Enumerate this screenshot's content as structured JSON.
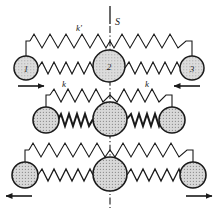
{
  "figure": {
    "background_color": "#ffffff",
    "ink_color": "#1a1a1a",
    "mass_fill_color": "#d9d9d9",
    "width": 219,
    "height": 215
  },
  "annotations": {
    "symmetry_axis_label": "S",
    "outer_spring_label": "k'",
    "inner_spring_label_left": "k",
    "inner_spring_label_right": "k",
    "mass_1_label": "1",
    "mass_2_label": "2",
    "mass_3_label": "3"
  },
  "modes": [
    {
      "name": "mode-1",
      "index": 1,
      "labels_visible": true,
      "masses": [
        {
          "id": "mass-1",
          "label": "1",
          "cx": 26,
          "cy": 68,
          "r": 12,
          "arrow": "right"
        },
        {
          "id": "mass-2",
          "label": "2",
          "cx": 109,
          "cy": 66,
          "r": 16,
          "arrow": "none"
        },
        {
          "id": "mass-3",
          "label": "3",
          "cx": 192,
          "cy": 68,
          "r": 12,
          "arrow": "left"
        }
      ],
      "arrow_directions": [
        "right",
        "none",
        "left"
      ],
      "spring_label_left": "k",
      "spring_label_right": "k",
      "outer_spring_label": "k'"
    },
    {
      "name": "mode-2",
      "index": 2,
      "labels_visible": false,
      "masses": [
        {
          "id": "mass-1",
          "label": "",
          "cx": 46,
          "cy": 120,
          "r": 13,
          "arrow": "none"
        },
        {
          "id": "mass-2",
          "label": "",
          "cx": 110,
          "cy": 119,
          "r": 17,
          "arrow": "none"
        },
        {
          "id": "mass-3",
          "label": "",
          "cx": 172,
          "cy": 120,
          "r": 13,
          "arrow": "none"
        }
      ],
      "arrow_directions": [
        "none",
        "none",
        "none"
      ],
      "spring_label_left": "",
      "spring_label_right": "",
      "outer_spring_label": ""
    },
    {
      "name": "mode-3",
      "index": 3,
      "labels_visible": false,
      "masses": [
        {
          "id": "mass-1",
          "label": "",
          "cx": 25,
          "cy": 175,
          "r": 13,
          "arrow": "left"
        },
        {
          "id": "mass-2",
          "label": "",
          "cx": 110,
          "cy": 174,
          "r": 17,
          "arrow": "none"
        },
        {
          "id": "mass-3",
          "label": "",
          "cx": 193,
          "cy": 175,
          "r": 13,
          "arrow": "right"
        }
      ],
      "arrow_directions": [
        "left",
        "none",
        "right"
      ],
      "spring_label_left": "",
      "spring_label_right": "",
      "outer_spring_label": ""
    }
  ]
}
